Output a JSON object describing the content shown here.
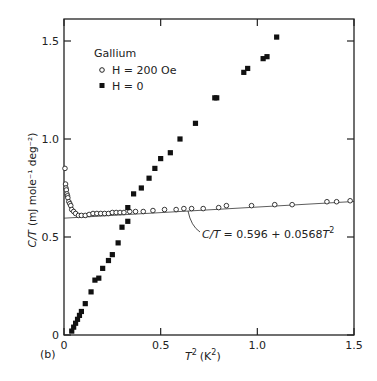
{
  "chart_data": {
    "type": "scatter",
    "title": "",
    "panel_label": "(b)",
    "legend_title": "Gallium",
    "xlabel": "T² (K²)",
    "ylabel": "C/T (mJ mole⁻¹ deg⁻²)",
    "xlim": [
      0,
      1.5
    ],
    "ylim": [
      0,
      1.6
    ],
    "xticks": [
      "0",
      "0.5",
      "1.0",
      "1.5"
    ],
    "yticks": [
      "0",
      "0.5",
      "1.0",
      "1.5"
    ],
    "legend_position": "upper-left",
    "grid": false,
    "series": [
      {
        "name": "H = 200 Oe",
        "marker": "open-circle",
        "x": [
          0.005,
          0.008,
          0.01,
          0.012,
          0.015,
          0.018,
          0.02,
          0.025,
          0.03,
          0.035,
          0.04,
          0.05,
          0.06,
          0.075,
          0.09,
          0.11,
          0.13,
          0.15,
          0.17,
          0.19,
          0.21,
          0.23,
          0.25,
          0.27,
          0.29,
          0.31,
          0.34,
          0.37,
          0.41,
          0.46,
          0.52,
          0.58,
          0.62,
          0.66,
          0.72,
          0.8,
          0.84,
          0.97,
          1.09,
          1.18,
          1.36,
          1.41,
          1.48
        ],
        "values": [
          0.85,
          0.77,
          0.75,
          0.74,
          0.72,
          0.71,
          0.7,
          0.68,
          0.67,
          0.66,
          0.64,
          0.63,
          0.62,
          0.61,
          0.61,
          0.61,
          0.615,
          0.62,
          0.62,
          0.62,
          0.62,
          0.62,
          0.625,
          0.625,
          0.625,
          0.625,
          0.63,
          0.63,
          0.63,
          0.635,
          0.64,
          0.64,
          0.645,
          0.645,
          0.645,
          0.65,
          0.66,
          0.66,
          0.665,
          0.665,
          0.68,
          0.68,
          0.685
        ]
      },
      {
        "name": "H = 0",
        "marker": "filled-square",
        "x": [
          0.04,
          0.05,
          0.06,
          0.07,
          0.08,
          0.09,
          0.11,
          0.14,
          0.16,
          0.18,
          0.2,
          0.23,
          0.25,
          0.28,
          0.3,
          0.33,
          0.33,
          0.36,
          0.4,
          0.44,
          0.47,
          0.5,
          0.55,
          0.6,
          0.68,
          0.78,
          0.79,
          0.93,
          0.95,
          1.03,
          1.05,
          1.1
        ],
        "values": [
          0.02,
          0.04,
          0.06,
          0.08,
          0.1,
          0.12,
          0.16,
          0.22,
          0.28,
          0.29,
          0.34,
          0.38,
          0.41,
          0.47,
          0.55,
          0.58,
          0.65,
          0.72,
          0.75,
          0.8,
          0.85,
          0.9,
          0.93,
          1.0,
          1.08,
          1.21,
          1.21,
          1.34,
          1.36,
          1.41,
          1.42,
          1.52
        ]
      }
    ],
    "fit_line": {
      "label": "C/T = 0.596 + 0.0568T²",
      "intercept": 0.596,
      "slope": 0.0568,
      "x_range": [
        0,
        1.5
      ]
    }
  },
  "page": {
    "panel_label": "(b)",
    "legend_title": "Gallium",
    "legend_items": [
      "H = 200 Oe",
      "H = 0"
    ],
    "fit_label_lhs": "C/T",
    "fit_label_rhs": " = 0.596 + 0.0568",
    "fit_label_T": "T",
    "fit_label_sup": "2",
    "xlabel_T": "T",
    "xlabel_sup": "2",
    "xlabel_units": "(K",
    "xlabel_units_sup": "2",
    "xlabel_units_close": ")",
    "ylabel_main": "C/T",
    "ylabel_units": "(mJ mole⁻¹ deg⁻²)"
  }
}
